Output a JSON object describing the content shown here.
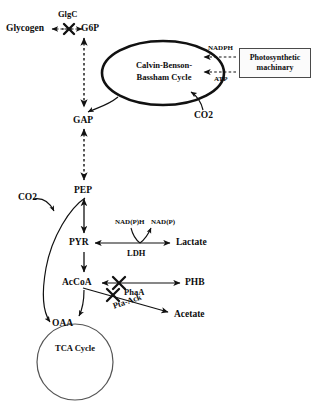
{
  "diagram": {
    "background_color": "#ffffff",
    "line_color": "#111111"
  },
  "metabolites": {
    "glycogen": "Glycogen",
    "g6p": "G6P",
    "gap": "GAP",
    "pep": "PEP",
    "pyr": "PYR",
    "accoa": "AcCoA",
    "oaa": "OAA",
    "lactate": "Lactate",
    "phb": "PHB",
    "acetate": "Acetate",
    "co2_calvin": "CO2",
    "co2_pep": "CO2"
  },
  "enzymes": {
    "glgc": "GlgC",
    "ldh": "LDH",
    "phaa": "PhaA",
    "pta_ack": "Pta-Ack"
  },
  "cofactors": {
    "nadph": "NADPH",
    "atp": "ATP",
    "nadph_ldh_in": "NAD(P)H",
    "nadp_ldh_out": "NAD(P)"
  },
  "cycles": {
    "calvin_line1": "Calvin-Benson-",
    "calvin_line2": "Bassham Cycle",
    "tca": "TCA Cycle"
  },
  "boxes": {
    "photosynthetic_line1": "Photosynthetic",
    "photosynthetic_line2": "machinary"
  },
  "knockouts": [
    {
      "id": "glgc-knockout",
      "enzyme": "GlgC",
      "reaction": "Glycogen <-> G6P"
    },
    {
      "id": "phaa-knockout",
      "enzyme": "PhaA",
      "reaction": "AcCoA <-> PHB"
    },
    {
      "id": "pta-ack-knockout",
      "enzyme": "Pta-Ack",
      "reaction": "AcCoA -> Acetate"
    }
  ]
}
